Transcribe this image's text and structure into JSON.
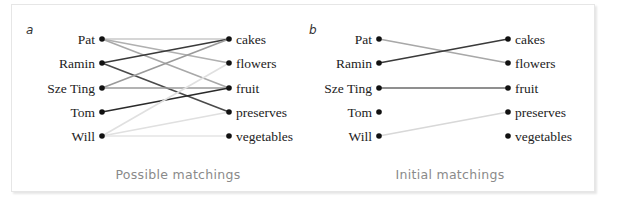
{
  "figure": {
    "panels": [
      {
        "id": "a",
        "label": "a",
        "caption": "Possible matchings",
        "left_nodes": [
          "Pat",
          "Ramin",
          "Sze Ting",
          "Tom",
          "Will"
        ],
        "right_nodes": [
          "cakes",
          "flowers",
          "fruit",
          "preserves",
          "vegetables"
        ],
        "edges": [
          {
            "from": "Pat",
            "to": "cakes",
            "color": "#c8c8c8"
          },
          {
            "from": "Pat",
            "to": "flowers",
            "color": "#b0b0b0"
          },
          {
            "from": "Pat",
            "to": "fruit",
            "color": "#a8a8a8"
          },
          {
            "from": "Ramin",
            "to": "cakes",
            "color": "#3a3a3a"
          },
          {
            "from": "Ramin",
            "to": "preserves",
            "color": "#4a4a4a"
          },
          {
            "from": "Sze Ting",
            "to": "cakes",
            "color": "#9a9a9a"
          },
          {
            "from": "Sze Ting",
            "to": "fruit",
            "color": "#9a9a9a"
          },
          {
            "from": "Tom",
            "to": "fruit",
            "color": "#2a2a2a"
          },
          {
            "from": "Will",
            "to": "flowers",
            "color": "#e0e0e0"
          },
          {
            "from": "Will",
            "to": "preserves",
            "color": "#e0e0e0"
          },
          {
            "from": "Will",
            "to": "vegetables",
            "color": "#e4e4e4"
          }
        ]
      },
      {
        "id": "b",
        "label": "b",
        "caption": "Initial matchings",
        "left_nodes": [
          "Pat",
          "Ramin",
          "Sze Ting",
          "Tom",
          "Will"
        ],
        "right_nodes": [
          "cakes",
          "flowers",
          "fruit",
          "preserves",
          "vegetables"
        ],
        "edges": [
          {
            "from": "Pat",
            "to": "flowers",
            "color": "#a8a8a8"
          },
          {
            "from": "Ramin",
            "to": "cakes",
            "color": "#3a3a3a"
          },
          {
            "from": "Sze Ting",
            "to": "fruit",
            "color": "#6a6a6a"
          },
          {
            "from": "Will",
            "to": "preserves",
            "color": "#d8d8d8"
          }
        ]
      }
    ]
  }
}
